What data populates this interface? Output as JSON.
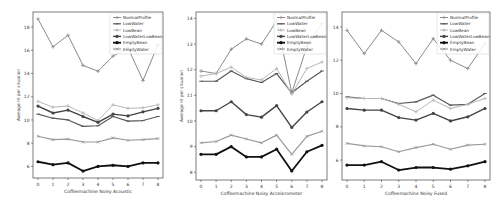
{
  "figure": {
    "ylabel": "Average HI per situation",
    "legend": [
      "NormalProfile",
      "LowWater",
      "LowBean",
      "LowWaterLowBean",
      "EmptyBean",
      "EmptyWater"
    ]
  },
  "series_styles": {
    "NormalProfile": {
      "color": "#8a8a8a",
      "marker": "+",
      "width": 1
    },
    "LowWater": {
      "color": "#5a5a5a",
      "marker": "_",
      "width": 1.2
    },
    "LowBean": {
      "color": "#b8b8b8",
      "marker": "+",
      "width": 1
    },
    "LowWaterLowBean": {
      "color": "#444444",
      "marker": "dot",
      "width": 1.4
    },
    "EmptyBean": {
      "color": "#111111",
      "marker": "dot",
      "width": 1.8
    },
    "EmptyWater": {
      "color": "#9a9a9a",
      "marker": "x",
      "width": 1.2
    }
  },
  "chart_data": [
    {
      "type": "line",
      "title": "",
      "xlabel": "Coffeemachine Noisy Acoustic",
      "ylabel": "Average HI per situation",
      "x": [
        0,
        1,
        2,
        3,
        4,
        5,
        6,
        7,
        8
      ],
      "yticks": [
        6,
        8,
        10,
        12,
        14,
        16,
        18
      ],
      "ylim": [
        5.0,
        19.3
      ],
      "legend_position": "upper right",
      "grid": false,
      "series": [
        {
          "name": "NormalProfile",
          "values": [
            18.7,
            16.3,
            17.3,
            14.7,
            14.2,
            15.5,
            16.2,
            13.4,
            16.5
          ]
        },
        {
          "name": "LowWater",
          "values": [
            10.5,
            10.15,
            10.0,
            9.45,
            9.5,
            10.3,
            9.9,
            9.95,
            10.3
          ]
        },
        {
          "name": "LowBean",
          "values": [
            11.6,
            11.1,
            11.2,
            10.6,
            9.95,
            11.3,
            11.0,
            11.05,
            11.3
          ]
        },
        {
          "name": "LowWaterLowBean",
          "values": [
            11.2,
            10.6,
            10.85,
            10.3,
            9.8,
            10.5,
            10.35,
            10.7,
            11.0
          ]
        },
        {
          "name": "EmptyBean",
          "values": [
            6.4,
            6.15,
            6.3,
            5.6,
            6.0,
            6.1,
            6.0,
            6.3,
            6.3
          ]
        },
        {
          "name": "EmptyWater",
          "values": [
            8.6,
            8.3,
            8.35,
            8.1,
            8.1,
            8.45,
            8.25,
            8.3,
            8.4
          ]
        }
      ]
    },
    {
      "type": "line",
      "title": "",
      "xlabel": "Coffeemachine Noisy Accelerometer",
      "ylabel": "Average HI per situation",
      "x": [
        0,
        1,
        2,
        3,
        4,
        5,
        6,
        7,
        8
      ],
      "yticks": [
        8,
        9,
        10,
        11,
        12,
        13,
        14
      ],
      "ylim": [
        7.7,
        14.25
      ],
      "legend_position": "upper right",
      "grid": false,
      "series": [
        {
          "name": "NormalProfile",
          "values": [
            11.95,
            11.85,
            12.8,
            13.2,
            13.0,
            13.9,
            11.1,
            12.9,
            13.8
          ]
        },
        {
          "name": "LowWater",
          "values": [
            11.55,
            11.55,
            11.95,
            11.65,
            11.5,
            11.85,
            11.1,
            11.55,
            11.95
          ]
        },
        {
          "name": "LowBean",
          "values": [
            11.75,
            11.85,
            12.1,
            11.7,
            11.6,
            12.05,
            11.05,
            12.05,
            12.3
          ]
        },
        {
          "name": "LowWaterLowBean",
          "values": [
            10.4,
            10.4,
            10.75,
            10.25,
            10.15,
            10.6,
            9.75,
            10.35,
            10.75
          ]
        },
        {
          "name": "EmptyBean",
          "values": [
            8.7,
            8.7,
            9.0,
            8.6,
            8.6,
            8.9,
            8.05,
            8.8,
            9.05
          ]
        },
        {
          "name": "EmptyWater",
          "values": [
            9.15,
            9.2,
            9.45,
            9.3,
            9.15,
            9.45,
            8.7,
            9.4,
            9.6
          ]
        }
      ]
    },
    {
      "type": "line",
      "title": "",
      "xlabel": "Coffeemachine Noisy Fused",
      "ylabel": "Average HI per situation",
      "x": [
        0,
        1,
        2,
        3,
        4,
        5,
        6,
        7,
        8
      ],
      "yticks": [
        6,
        8,
        10,
        12,
        14
      ],
      "ylim": [
        4.8,
        14.9
      ],
      "legend_position": "upper right",
      "grid": false,
      "series": [
        {
          "name": "NormalProfile",
          "values": [
            13.8,
            12.4,
            13.8,
            13.1,
            11.8,
            13.3,
            12.0,
            11.5,
            13.0
          ]
        },
        {
          "name": "LowWater",
          "values": [
            9.8,
            9.7,
            9.7,
            9.4,
            9.5,
            9.9,
            9.3,
            9.35,
            10.0
          ]
        },
        {
          "name": "LowBean",
          "values": [
            9.75,
            9.7,
            9.7,
            9.35,
            8.9,
            9.6,
            9.1,
            9.35,
            9.7
          ]
        },
        {
          "name": "LowWaterLowBean",
          "values": [
            9.1,
            9.0,
            9.0,
            8.55,
            8.4,
            8.8,
            8.35,
            8.6,
            9.1
          ]
        },
        {
          "name": "EmptyBean",
          "values": [
            5.7,
            5.7,
            5.9,
            5.4,
            5.55,
            5.55,
            5.45,
            5.65,
            5.9
          ]
        },
        {
          "name": "EmptyWater",
          "values": [
            7.0,
            6.85,
            6.8,
            6.5,
            6.75,
            6.95,
            6.65,
            6.9,
            6.95
          ]
        }
      ]
    }
  ]
}
